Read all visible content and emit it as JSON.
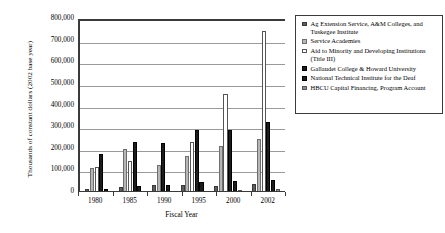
{
  "chart_data": {
    "type": "bar",
    "title": "",
    "subtitle": "",
    "xlabel": "Fiscal Year",
    "ylabel": "Thousands of constant dollars (2002 base year)",
    "categories": [
      "1980",
      "1985",
      "1990",
      "1995",
      "2000",
      "2002"
    ],
    "ylim": [
      0,
      800000
    ],
    "ytick_labels": [
      "800,000",
      "700,000",
      "600,000",
      "500,000",
      "400,000",
      "300,000",
      "200,000",
      "100,000",
      "0"
    ],
    "ytick_values": [
      800000,
      700000,
      600000,
      500000,
      400000,
      300000,
      200000,
      100000,
      0
    ],
    "grid": true,
    "legend_position": "right",
    "series": [
      {
        "name": "Ag Extension Service, A&M Colleges, and Tuskegee Institute",
        "color": "#5d5d5d",
        "values": [
          15000,
          22000,
          33000,
          33000,
          30000,
          35000
        ]
      },
      {
        "name": "Service Academies",
        "color": "#b6b6b6",
        "values": [
          110000,
          200000,
          125000,
          165000,
          215000,
          245000
        ]
      },
      {
        "name": "Aid to Minority and Developing Institutions (Title III)",
        "color": "#ffffff",
        "values": [
          115000,
          143000,
          0,
          230000,
          455000,
          745000
        ]
      },
      {
        "name": "Gallaudet College & Howard University",
        "color": "#1c1c1c",
        "values": [
          175000,
          230000,
          228000,
          288000,
          288000,
          325000
        ]
      },
      {
        "name": "National Technical Institute for the Deaf",
        "color": "#1c1c1c",
        "values": [
          15000,
          30000,
          32000,
          45000,
          50000,
          55000
        ]
      },
      {
        "name": "HBCU Capital Financing, Program Account",
        "color": "#8c8c8c",
        "values": [
          0,
          0,
          0,
          0,
          10000,
          12000
        ]
      }
    ]
  },
  "legend": {
    "items": [
      {
        "label": "Ag Extension Service, A&M Colleges, and Tuskegee Institute"
      },
      {
        "label": "Service Academies"
      },
      {
        "label": "Aid to Minority and Developing Institutions (Title III)"
      },
      {
        "label": "Gallaudet College & Howard University"
      },
      {
        "label": "National Technical Institute for the Deaf"
      },
      {
        "label": "HBCU Capital Financing, Program Account"
      }
    ]
  }
}
